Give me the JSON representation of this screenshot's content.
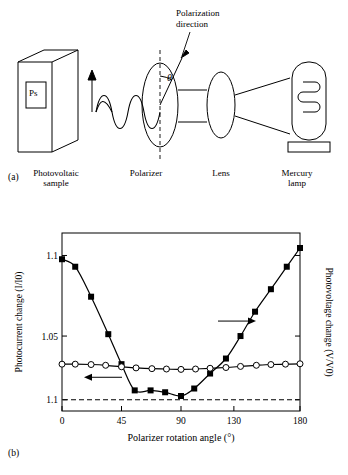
{
  "figure": {
    "panel_a_label": "(a)",
    "panel_b_label": "(b)",
    "diagram": {
      "sample_label": "Ps",
      "sample_caption": "Photovoltaic\nsample",
      "polarizer_caption": "Polarizer",
      "lens_caption": "Lens",
      "lamp_caption": "Mercury\nlamp",
      "angle_symbol": "θ",
      "polarization_direction_text": "Polarization\ndirection"
    }
  },
  "chart_data": {
    "type": "scatter",
    "title": "",
    "xlabel": "Polarizer rotation angle (°)",
    "ylabel_left": "Photocurrent change (I/I0)",
    "ylabel_right": "Photovoltage change (V/V0)",
    "xlim": [
      0,
      180
    ],
    "xticks": [
      0,
      45,
      90,
      130,
      180
    ],
    "xtick_labels": [
      "0",
      "45",
      "90",
      "130",
      "180"
    ],
    "ylim_left": [
      1.088,
      1.135
    ],
    "yticks_left": [
      1.1,
      1.05,
      1.1
    ],
    "ytick_labels_left": [
      "1.1",
      "1.05",
      "1.1"
    ],
    "grid": false,
    "legend": "none",
    "annotations": [
      {
        "text": "arrow-right",
        "meaning": "right axis series (filled squares)"
      },
      {
        "text": "arrow-left",
        "meaning": "left axis series (open circles)"
      },
      {
        "text": "dashed-baseline",
        "meaning": "horizontal dashed reference line at 1.1"
      }
    ],
    "series": [
      {
        "name": "Photovoltage change (V/V0)",
        "axis": "right",
        "marker": "filled-square",
        "x": [
          0,
          10,
          22,
          35,
          45,
          55,
          67,
          78,
          90,
          100,
          112,
          124,
          135,
          146,
          158,
          170,
          180
        ],
        "y": [
          1.128,
          1.126,
          1.118,
          1.108,
          1.1,
          1.093,
          1.093,
          1.0925,
          1.0915,
          1.0935,
          1.0975,
          1.1015,
          1.1075,
          1.114,
          1.12,
          1.126,
          1.131
        ]
      },
      {
        "name": "Photocurrent change (I/I0)",
        "axis": "left",
        "marker": "open-circle",
        "x": [
          0,
          10,
          22,
          33,
          45,
          56,
          68,
          79,
          90,
          101,
          112,
          124,
          135,
          147,
          158,
          169,
          180
        ],
        "y": [
          1.1,
          1.1,
          1.0999,
          1.0997,
          1.0993,
          1.099,
          1.0988,
          1.0987,
          1.0986,
          1.0987,
          1.0989,
          1.0991,
          1.0994,
          1.0997,
          1.0999,
          1.1,
          1.1001
        ]
      }
    ]
  }
}
